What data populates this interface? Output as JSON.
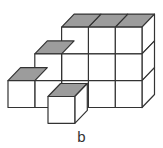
{
  "figure": {
    "type": "cube-stack",
    "caption": "b",
    "colors": {
      "top_face": "#9c9c9c",
      "front_face": "#ffffff",
      "edge": "#333333"
    },
    "structure": {
      "back_wall_columns": [
        {
          "column": 0,
          "height": 1
        },
        {
          "column": 1,
          "height": 2
        },
        {
          "column": 2,
          "height": 3
        },
        {
          "column": 3,
          "height": 3
        },
        {
          "column": 4,
          "height": 3
        }
      ],
      "front_cubes": [
        {
          "position": "in front of columns 1-2",
          "height": 1
        }
      ],
      "total_cubes": 13
    }
  }
}
